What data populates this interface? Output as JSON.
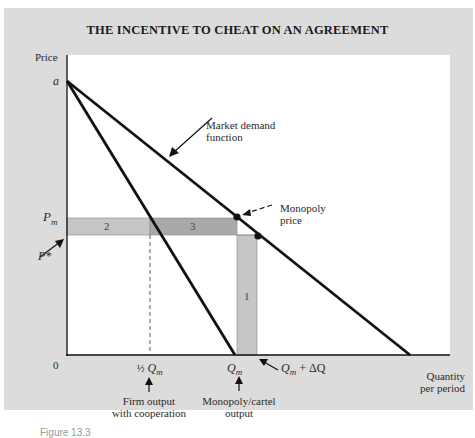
{
  "title": "THE INCENTIVE TO CHEAT ON AN AGREEMENT",
  "axes": {
    "y_label": "Price",
    "x_label_line1": "Quantity",
    "x_label_line2": "per period",
    "origin": "0",
    "y_intercept": "a"
  },
  "price_labels": {
    "pm": "P",
    "pm_sub": "m",
    "pstar": "P*"
  },
  "quantity_labels": {
    "half_qm_frac": "½",
    "half_qm": "Q",
    "half_qm_sub": "m",
    "qm": "Q",
    "qm_sub": "m",
    "qm_delta": "Q",
    "qm_delta_sub": "m",
    "qm_delta_rest": " + ΔQ"
  },
  "annotations": {
    "market_demand_line1": "Market demand",
    "market_demand_line2": "function",
    "monopoly_price_line1": "Monopoly",
    "monopoly_price_line2": "price",
    "firm_output_line1": "Firm output",
    "firm_output_line2": "with cooperation",
    "cartel_output_line1": "Monopoly/cartel",
    "cartel_output_line2": "output"
  },
  "regions": {
    "r1": "1",
    "r2": "2",
    "r3": "3"
  },
  "footer": "Figure 13.3",
  "colors": {
    "panel_bg": "#dcdcdc",
    "plot_bg": "#ffffff",
    "line": "#111111",
    "region_light": "#c4c4c4",
    "region_dark": "#a8a8a8"
  }
}
